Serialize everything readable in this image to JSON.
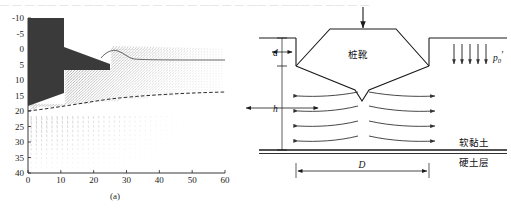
{
  "figure": {
    "ghost_text_top": "— — —  —— — —  ——  — ——  — — —— —  —— — — ——  — ——— — ——  — —",
    "ghost_text_bottom": "— ——  —— — ——  ——"
  },
  "panel_a": {
    "caption": "(a)",
    "yticks": [
      "-10",
      "-5",
      "0",
      "5",
      "10",
      "15",
      "20",
      "25",
      "30",
      "35",
      "40"
    ],
    "xticks": [
      "0",
      "10",
      "20",
      "30",
      "40",
      "50",
      "60"
    ],
    "spudcan_fill": "#3a3a3a",
    "vector_color": "#6a6a6a",
    "dashed_color": "#2b2b2b"
  },
  "panel_b": {
    "caption": "(b)",
    "spudcan_label": "桩靴",
    "soft_clay_label": "软黏土",
    "hard_layer_label": "硬土层",
    "depth_label": "d",
    "height_label": "h",
    "diameter_label": "D",
    "pressure_label": "p",
    "pressure_sub": "0",
    "pressure_prime": "′",
    "line_color": "#1a1a1a",
    "flow_color": "#333333"
  },
  "chart_data": {
    "type": "scatter",
    "title": "",
    "xlabel": "",
    "ylabel": "",
    "xlim": [
      0,
      60
    ],
    "ylim": [
      40,
      -10
    ],
    "xticks": [
      0,
      10,
      20,
      30,
      40,
      50,
      60
    ],
    "yticks": [
      -10,
      -5,
      0,
      5,
      10,
      15,
      20,
      25,
      30,
      35,
      40
    ],
    "grid": false,
    "legend": "none",
    "series": [
      {
        "name": "spudcan-body",
        "type": "polygon",
        "points": [
          [
            0,
            -10
          ],
          [
            11,
            -10
          ],
          [
            11,
            -1
          ],
          [
            25,
            4
          ],
          [
            25,
            6
          ],
          [
            11,
            6
          ],
          [
            11,
            13
          ],
          [
            0,
            17
          ]
        ]
      },
      {
        "name": "soil-surface-heave",
        "type": "line",
        "x": [
          22,
          24,
          26,
          28,
          30,
          32,
          36,
          42,
          50,
          60
        ],
        "y": [
          1.2,
          0.2,
          -0.6,
          -1.1,
          -0.8,
          -0.2,
          0.1,
          0.15,
          0.15,
          0.15
        ]
      },
      {
        "name": "hard-layer-interface",
        "type": "dashed-line",
        "x": [
          0,
          8,
          16,
          24,
          32,
          40,
          48,
          56,
          60
        ],
        "y": [
          18.6,
          18.1,
          17.2,
          16.4,
          15.7,
          15.3,
          15.1,
          15.0,
          15.0
        ]
      },
      {
        "name": "displacement-vector-field",
        "type": "quiver",
        "description": "dense grey displacement vectors; steeply inclined shear fan above dashed interface, near-vertical downward vectors below from y=19 to y=40"
      }
    ]
  }
}
